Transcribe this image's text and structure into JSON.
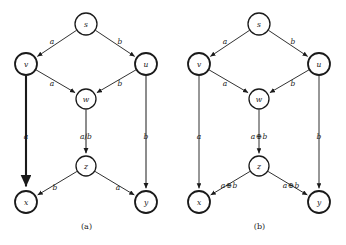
{
  "figure": {
    "panels": [
      {
        "id": "a",
        "caption": "(a)",
        "nodes": [
          {
            "id": "s",
            "label": "s",
            "cx": 86,
            "cy": 24,
            "r": 11,
            "stroke_width": 1.3
          },
          {
            "id": "v",
            "label": "v",
            "cx": 26,
            "cy": 64,
            "r": 11,
            "stroke_width": 1.8
          },
          {
            "id": "u",
            "label": "u",
            "cx": 146,
            "cy": 64,
            "r": 11,
            "stroke_width": 1.8
          },
          {
            "id": "w",
            "label": "w",
            "cx": 86,
            "cy": 99,
            "r": 10,
            "stroke_width": 1.3
          },
          {
            "id": "z",
            "label": "z",
            "cx": 86,
            "cy": 166,
            "r": 10,
            "stroke_width": 1.3
          },
          {
            "id": "x",
            "label": "x",
            "cx": 26,
            "cy": 202,
            "r": 11,
            "stroke_width": 1.8
          },
          {
            "id": "y",
            "label": "y",
            "cx": 146,
            "cy": 202,
            "r": 11,
            "stroke_width": 1.8
          }
        ],
        "edges": [
          {
            "from": "s",
            "to": "v",
            "label": "a",
            "lx": 52,
            "ly": 41,
            "width": 0.9
          },
          {
            "from": "s",
            "to": "u",
            "label": "b",
            "lx": 120,
            "ly": 41,
            "width": 0.9
          },
          {
            "from": "v",
            "to": "w",
            "label": "a",
            "lx": 52,
            "ly": 83,
            "width": 0.9
          },
          {
            "from": "u",
            "to": "w",
            "label": "b",
            "lx": 120,
            "ly": 83,
            "width": 0.9
          },
          {
            "from": "v",
            "to": "x",
            "label": "a",
            "lx": 26,
            "ly": 136,
            "width": 2.1
          },
          {
            "from": "w",
            "to": "z",
            "label": "a/b",
            "lx": 86,
            "ly": 136,
            "width": 1.0
          },
          {
            "from": "u",
            "to": "y",
            "label": "b",
            "lx": 146,
            "ly": 136,
            "width": 1.0
          },
          {
            "from": "z",
            "to": "x",
            "label": "b",
            "lx": 55,
            "ly": 187,
            "width": 0.9
          },
          {
            "from": "z",
            "to": "y",
            "label": "a",
            "lx": 118,
            "ly": 187,
            "width": 0.9
          }
        ]
      },
      {
        "id": "b",
        "caption": "(b)",
        "nodes": [
          {
            "id": "s",
            "label": "s",
            "cx": 86,
            "cy": 24,
            "r": 11,
            "stroke_width": 1.3
          },
          {
            "id": "v",
            "label": "v",
            "cx": 26,
            "cy": 64,
            "r": 11,
            "stroke_width": 1.8
          },
          {
            "id": "u",
            "label": "u",
            "cx": 146,
            "cy": 64,
            "r": 11,
            "stroke_width": 1.8
          },
          {
            "id": "w",
            "label": "w",
            "cx": 86,
            "cy": 99,
            "r": 10,
            "stroke_width": 1.3
          },
          {
            "id": "z",
            "label": "z",
            "cx": 86,
            "cy": 166,
            "r": 10,
            "stroke_width": 1.3
          },
          {
            "id": "x",
            "label": "x",
            "cx": 26,
            "cy": 202,
            "r": 11,
            "stroke_width": 1.8
          },
          {
            "id": "y",
            "label": "y",
            "cx": 146,
            "cy": 202,
            "r": 11,
            "stroke_width": 1.8
          }
        ],
        "edges": [
          {
            "from": "s",
            "to": "v",
            "label": "a",
            "lx": 52,
            "ly": 41,
            "width": 0.9
          },
          {
            "from": "s",
            "to": "u",
            "label": "b",
            "lx": 120,
            "ly": 41,
            "width": 0.9
          },
          {
            "from": "v",
            "to": "w",
            "label": "a",
            "lx": 52,
            "ly": 83,
            "width": 0.9
          },
          {
            "from": "u",
            "to": "w",
            "label": "b",
            "lx": 120,
            "ly": 83,
            "width": 0.9
          },
          {
            "from": "v",
            "to": "x",
            "label": "a",
            "lx": 26,
            "ly": 136,
            "width": 0.9
          },
          {
            "from": "w",
            "to": "z",
            "label": "a⊕b",
            "lx": 86,
            "ly": 136,
            "width": 0.9
          },
          {
            "from": "u",
            "to": "y",
            "label": "b",
            "lx": 146,
            "ly": 136,
            "width": 0.9
          },
          {
            "from": "z",
            "to": "x",
            "label": "a⊕b",
            "lx": 56,
            "ly": 185,
            "width": 0.9
          },
          {
            "from": "z",
            "to": "y",
            "label": "a⊕b",
            "lx": 118,
            "ly": 185,
            "width": 0.9
          }
        ]
      }
    ]
  },
  "colors": {
    "ink": "#1a1a1a",
    "background": "#ffffff"
  }
}
